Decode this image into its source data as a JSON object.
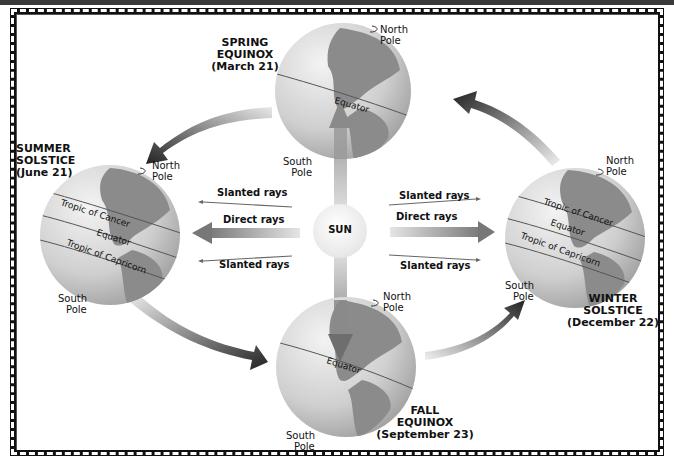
{
  "header": {
    "title": "Seasons"
  },
  "colors": {
    "globe_light": "#e6e6e6",
    "globe_dark": "#9a9a9a",
    "land": "#7d7d7d",
    "arrow_dark": "#2c2c2c",
    "arrow_light": "#d8d8d8",
    "sun": "#f2f2f2",
    "border": "#111111"
  },
  "sun": {
    "label": "SUN"
  },
  "rays": {
    "left": {
      "top": "Slanted rays",
      "middle": "Direct rays",
      "bottom": "Slanted rays"
    },
    "right": {
      "top": "Slanted rays",
      "middle": "Direct rays",
      "bottom": "Slanted rays"
    }
  },
  "seasons": {
    "spring": {
      "line1": "SPRING",
      "line2": "EQUINOX",
      "line3": "(March 21)",
      "north_pole": [
        "North",
        "Pole"
      ],
      "south_pole": [
        "South",
        "Pole"
      ],
      "lines": [
        "Equator"
      ]
    },
    "summer": {
      "line1": "SUMMER",
      "line2": "SOLSTICE",
      "line3": "(June 21)",
      "north_pole": [
        "North",
        "Pole"
      ],
      "south_pole": [
        "South",
        "Pole"
      ],
      "lines": [
        "Tropic of Cancer",
        "Equator",
        "Tropic of Capricorn"
      ]
    },
    "winter": {
      "line1": "WINTER",
      "line2": "SOLSTICE",
      "line3": "(December 22)",
      "north_pole": [
        "North",
        "Pole"
      ],
      "south_pole": [
        "South",
        "Pole"
      ],
      "lines": [
        "Tropic of Cancer",
        "Equator",
        "Tropic of Capricorn"
      ]
    },
    "fall": {
      "line1": "FALL",
      "line2": "EQUINOX",
      "line3": "(September 23)",
      "north_pole": [
        "North",
        "Pole"
      ],
      "south_pole": [
        "South",
        "Pole"
      ],
      "lines": [
        "Equator"
      ]
    }
  }
}
